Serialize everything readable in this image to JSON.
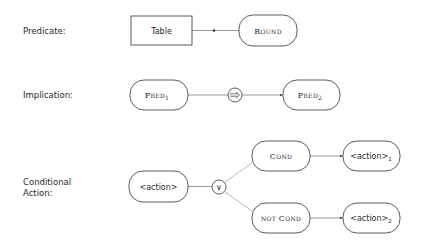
{
  "rows": [
    {
      "label": "Predicate:",
      "nodes": {
        "table": "Table",
        "round": "Round"
      }
    },
    {
      "label": "Implication:",
      "nodes": {
        "pred1": "Pred",
        "pred1_sub": "1",
        "operator": "⟹",
        "pred2": "Pred",
        "pred2_sub": "2"
      }
    },
    {
      "label_line1": "Conditional",
      "label_line2": "Action:",
      "nodes": {
        "action": "<action>",
        "operator": "∨",
        "cond": "Cond",
        "not_cond": "not Cond",
        "action1": "<action>",
        "action1_sub": "1",
        "action2": "<action>",
        "action2_sub": "2"
      }
    }
  ],
  "colors": {
    "stroke": "#333333",
    "text": "#2a2a2a",
    "background": "#ffffff"
  }
}
